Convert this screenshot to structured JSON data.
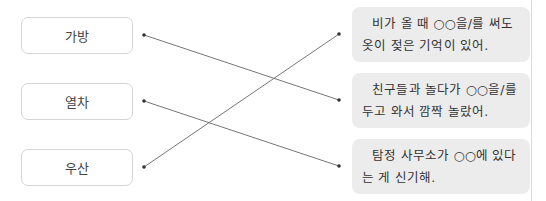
{
  "left_items": [
    {
      "label": "가방"
    },
    {
      "label": "열차"
    },
    {
      "label": "우산"
    }
  ],
  "right_items": [
    {
      "text": "비가 올 때 ○○을/를 써도 옷이 젖은 기억이 있어."
    },
    {
      "text": "친구들과 놀다가 ○○을/를 두고 와서 깜짝 놀랐어."
    },
    {
      "text": "탐정 사무소가 ○○에 있다는 게 신기해."
    }
  ],
  "connections": [
    {
      "from": "가방",
      "to": 2
    },
    {
      "from": "열차",
      "to": 3
    },
    {
      "from": "우산",
      "to": 1
    }
  ],
  "colors": {
    "line": "#777777",
    "right_box_bg": "#ececec",
    "left_box_border": "#d4d4d4"
  }
}
